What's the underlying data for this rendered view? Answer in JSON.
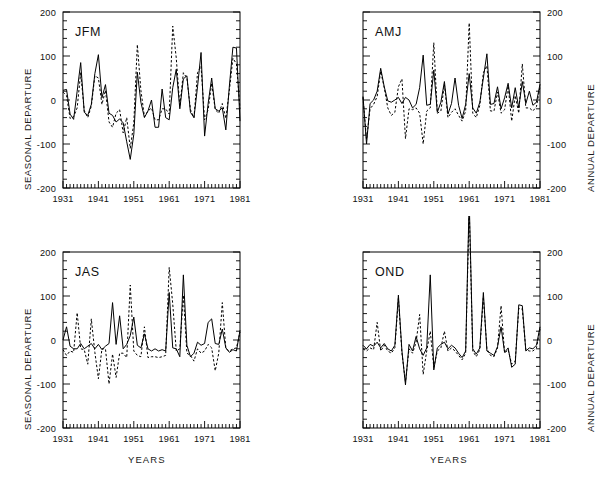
{
  "figure": {
    "title": "",
    "xlabel": "YEARS",
    "left_ylabel": "SEASONAL DEPARTURE",
    "right_ylabel": "ANNUAL DEPARTURE",
    "xticks": [
      "1931",
      "1941",
      "1951",
      "1961",
      "1971",
      "1981"
    ],
    "xtick_values": [
      1931,
      1941,
      1951,
      1961,
      1971,
      1981
    ],
    "yticks": [
      "200",
      "100",
      "0",
      "-100",
      "-200"
    ],
    "ytick_values": [
      200,
      100,
      0,
      -100,
      -200
    ],
    "xlim": [
      1931,
      1981
    ],
    "ylim": [
      -200,
      200
    ],
    "line_color": "#000000",
    "frame_color": "#000000"
  },
  "chart_data": [
    {
      "type": "line",
      "panel": "JFM",
      "title": "JFM",
      "position": "top-left",
      "xlabel": "",
      "ylabel": "SEASONAL DEPARTURE",
      "ylabel_side": "left",
      "xlim": [
        1931,
        1981
      ],
      "ylim": [
        -200,
        200
      ],
      "grid": false,
      "legend": "none",
      "x": [
        1931,
        1932,
        1933,
        1934,
        1935,
        1936,
        1937,
        1938,
        1939,
        1940,
        1941,
        1942,
        1943,
        1944,
        1945,
        1946,
        1947,
        1948,
        1949,
        1950,
        1951,
        1952,
        1953,
        1954,
        1955,
        1956,
        1957,
        1958,
        1959,
        1960,
        1961,
        1962,
        1963,
        1964,
        1965,
        1966,
        1967,
        1968,
        1969,
        1970,
        1971,
        1972,
        1973,
        1974,
        1975,
        1976,
        1977,
        1978,
        1979,
        1980,
        1981
      ],
      "series": [
        {
          "name": "seasonal-departure-solid",
          "style": "solid",
          "values": [
            22,
            24,
            -32,
            -44,
            20,
            85,
            -28,
            -35,
            -10,
            60,
            103,
            5,
            35,
            -30,
            -35,
            -50,
            -43,
            -52,
            -95,
            -135,
            -78,
            63,
            -5,
            -40,
            -25,
            0,
            -62,
            -62,
            25,
            -40,
            -45,
            28,
            70,
            -20,
            48,
            55,
            -28,
            -40,
            30,
            108,
            -82,
            -8,
            50,
            -20,
            -25,
            -18,
            -68,
            32,
            120,
            118,
            -48
          ]
        },
        {
          "name": "annual-departure-dashed",
          "style": "dashed",
          "values": [
            18,
            10,
            -42,
            -38,
            -18,
            62,
            -24,
            -40,
            -14,
            55,
            50,
            -10,
            22,
            -50,
            -62,
            -30,
            -22,
            -75,
            -40,
            -110,
            -52,
            126,
            22,
            -38,
            -25,
            -18,
            -45,
            -45,
            -20,
            -20,
            -32,
            168,
            95,
            -15,
            62,
            50,
            -22,
            -40,
            62,
            77,
            -45,
            -22,
            38,
            -22,
            -30,
            -8,
            -42,
            22,
            95,
            82,
            -20
          ]
        }
      ]
    },
    {
      "type": "line",
      "panel": "AMJ",
      "title": "AMJ",
      "position": "top-right",
      "xlabel": "",
      "ylabel": "ANNUAL DEPARTURE",
      "ylabel_side": "right",
      "xlim": [
        1931,
        1981
      ],
      "ylim": [
        -200,
        200
      ],
      "grid": false,
      "legend": "none",
      "x": [
        1931,
        1932,
        1933,
        1934,
        1935,
        1936,
        1937,
        1938,
        1939,
        1940,
        1941,
        1942,
        1943,
        1944,
        1945,
        1946,
        1947,
        1948,
        1949,
        1950,
        1951,
        1952,
        1953,
        1954,
        1955,
        1956,
        1957,
        1958,
        1959,
        1960,
        1961,
        1962,
        1963,
        1964,
        1965,
        1966,
        1967,
        1968,
        1969,
        1970,
        1971,
        1972,
        1973,
        1974,
        1975,
        1976,
        1977,
        1978,
        1979,
        1980,
        1981
      ],
      "series": [
        {
          "name": "seasonal-departure-solid",
          "style": "solid",
          "values": [
            8,
            -100,
            -8,
            0,
            20,
            72,
            30,
            -2,
            -5,
            0,
            6,
            -8,
            6,
            0,
            -18,
            -10,
            28,
            102,
            -12,
            -10,
            68,
            -28,
            -5,
            42,
            -32,
            -8,
            50,
            -12,
            -42,
            -10,
            60,
            -18,
            -30,
            -5,
            50,
            105,
            -10,
            -8,
            30,
            -20,
            5,
            38,
            -18,
            28,
            -18,
            42,
            -8,
            20,
            -12,
            -5,
            36
          ]
        },
        {
          "name": "annual-departure-dashed",
          "style": "dashed",
          "values": [
            6,
            -90,
            -20,
            -10,
            8,
            65,
            28,
            -18,
            -35,
            -28,
            30,
            48,
            -88,
            -20,
            -22,
            -18,
            -30,
            -100,
            -25,
            -18,
            130,
            -30,
            -25,
            35,
            -40,
            -28,
            -20,
            -35,
            -48,
            -25,
            175,
            -30,
            -40,
            -12,
            62,
            78,
            -25,
            -25,
            18,
            -30,
            -22,
            32,
            -48,
            10,
            -30,
            82,
            -18,
            -18,
            -25,
            -15,
            30
          ]
        }
      ]
    },
    {
      "type": "line",
      "panel": "JAS",
      "title": "JAS",
      "position": "bottom-left",
      "xlabel": "YEARS",
      "ylabel": "SEASONAL DEPARTURE",
      "ylabel_side": "left",
      "xlim": [
        1931,
        1981
      ],
      "ylim": [
        -200,
        200
      ],
      "grid": false,
      "legend": "none",
      "x": [
        1931,
        1932,
        1933,
        1934,
        1935,
        1936,
        1937,
        1938,
        1939,
        1940,
        1941,
        1942,
        1943,
        1944,
        1945,
        1946,
        1947,
        1948,
        1949,
        1950,
        1951,
        1952,
        1953,
        1954,
        1955,
        1956,
        1957,
        1958,
        1959,
        1960,
        1961,
        1962,
        1963,
        1964,
        1965,
        1966,
        1967,
        1968,
        1969,
        1970,
        1971,
        1972,
        1973,
        1974,
        1975,
        1976,
        1977,
        1978,
        1979,
        1980,
        1981
      ],
      "series": [
        {
          "name": "seasonal-departure-solid",
          "style": "solid",
          "values": [
            0,
            30,
            -14,
            -20,
            -20,
            -8,
            -20,
            -14,
            -8,
            -20,
            -10,
            -22,
            -14,
            -8,
            85,
            -10,
            55,
            -20,
            -10,
            10,
            52,
            -12,
            -18,
            14,
            -20,
            -25,
            -20,
            -25,
            -22,
            -25,
            108,
            -18,
            -20,
            -38,
            148,
            -12,
            -38,
            -30,
            -5,
            -12,
            -8,
            40,
            48,
            -8,
            -10,
            25,
            -18,
            -28,
            -22,
            -25,
            22
          ]
        },
        {
          "name": "annual-departure-dashed",
          "style": "dashed",
          "values": [
            -22,
            -35,
            -25,
            -28,
            62,
            -20,
            -22,
            -55,
            48,
            -28,
            -88,
            -20,
            -20,
            -100,
            -32,
            -85,
            -30,
            -30,
            -40,
            125,
            -25,
            -35,
            -38,
            30,
            -40,
            -38,
            -38,
            -40,
            -38,
            -35,
            165,
            82,
            -25,
            -20,
            102,
            -30,
            -35,
            -48,
            -20,
            -30,
            -25,
            -10,
            -18,
            -70,
            -30,
            85,
            -20,
            -25,
            -20,
            -18,
            18
          ]
        }
      ]
    },
    {
      "type": "line",
      "panel": "OND",
      "title": "OND",
      "position": "bottom-right",
      "xlabel": "YEARS",
      "ylabel": "ANNUAL DEPARTURE",
      "ylabel_side": "right",
      "xlim": [
        1931,
        1981
      ],
      "ylim": [
        -200,
        200
      ],
      "grid": false,
      "legend": "none",
      "note": "1961 spike exceeds axis top and is drawn beyond the frame",
      "x": [
        1931,
        1932,
        1933,
        1934,
        1935,
        1936,
        1937,
        1938,
        1939,
        1940,
        1941,
        1942,
        1943,
        1944,
        1945,
        1946,
        1947,
        1948,
        1949,
        1950,
        1951,
        1952,
        1953,
        1954,
        1955,
        1956,
        1957,
        1958,
        1959,
        1960,
        1961,
        1962,
        1963,
        1964,
        1965,
        1966,
        1967,
        1968,
        1969,
        1970,
        1971,
        1972,
        1973,
        1974,
        1975,
        1976,
        1977,
        1978,
        1979,
        1980,
        1981
      ],
      "series": [
        {
          "name": "seasonal-departure-solid",
          "style": "solid",
          "values": [
            -12,
            -20,
            -10,
            -14,
            -5,
            -18,
            -8,
            -20,
            -25,
            -12,
            102,
            -25,
            -102,
            -10,
            -25,
            8,
            -20,
            -35,
            -18,
            148,
            -68,
            -18,
            -10,
            -5,
            -20,
            -12,
            -18,
            -30,
            -40,
            -25,
            320,
            -20,
            -32,
            -18,
            108,
            -25,
            -30,
            -35,
            -15,
            30,
            -28,
            -18,
            -62,
            -55,
            80,
            78,
            -25,
            -18,
            -20,
            -12,
            30
          ]
        },
        {
          "name": "annual-departure-dashed",
          "style": "dashed",
          "values": [
            -20,
            -25,
            -18,
            -22,
            40,
            -25,
            -12,
            -25,
            -30,
            -18,
            95,
            -30,
            -95,
            -20,
            -30,
            -5,
            58,
            -78,
            -25,
            20,
            -62,
            -25,
            -18,
            20,
            -25,
            -18,
            -25,
            -35,
            -45,
            -30,
            300,
            -25,
            -38,
            -22,
            98,
            -20,
            -35,
            -38,
            -18,
            78,
            -30,
            -22,
            -55,
            -48,
            72,
            70,
            -22,
            -25,
            -25,
            -18,
            25
          ]
        }
      ]
    }
  ]
}
